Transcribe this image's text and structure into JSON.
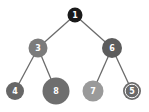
{
  "diagram": {
    "type": "binary-tree",
    "background": "#ffffff",
    "edge_color": "#6b6b6b",
    "nodes": [
      {
        "id": "n1",
        "label": "1",
        "x": 75,
        "y": 15,
        "r": 7.5,
        "fill": "#1a1a1a",
        "ring": false
      },
      {
        "id": "n3",
        "label": "3",
        "x": 38,
        "y": 48,
        "r": 9.5,
        "fill": "#7b7b7b",
        "ring": false
      },
      {
        "id": "n6",
        "label": "6",
        "x": 112,
        "y": 48,
        "r": 10,
        "fill": "#5c5c5c",
        "ring": false
      },
      {
        "id": "n4",
        "label": "4",
        "x": 15,
        "y": 91,
        "r": 9,
        "fill": "#676767",
        "ring": false
      },
      {
        "id": "n8",
        "label": "8",
        "x": 56,
        "y": 91,
        "r": 13.5,
        "fill": "#6e6e6e",
        "ring": false
      },
      {
        "id": "n7",
        "label": "7",
        "x": 93,
        "y": 91,
        "r": 10.5,
        "fill": "#9a9a9a",
        "ring": false
      },
      {
        "id": "n5",
        "label": "5",
        "x": 132,
        "y": 91,
        "r": 9,
        "fill": "#6a6a6a",
        "ring": true
      }
    ],
    "edges": [
      {
        "from": "n1",
        "to": "n3"
      },
      {
        "from": "n1",
        "to": "n6"
      },
      {
        "from": "n3",
        "to": "n4"
      },
      {
        "from": "n3",
        "to": "n8"
      },
      {
        "from": "n6",
        "to": "n7"
      },
      {
        "from": "n6",
        "to": "n5"
      }
    ]
  }
}
